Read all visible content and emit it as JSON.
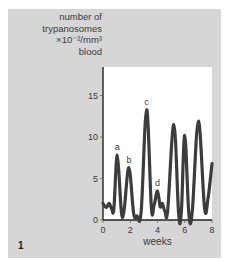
{
  "figure_number": "1",
  "colors": {
    "panel_background": "#d6d6d6",
    "plot_background": "#ffffff",
    "curve": "#3c3c3c",
    "text": "#3a3a3a"
  },
  "chart_data": {
    "type": "line",
    "title": "",
    "ylabel_lines": [
      "number of",
      "trypanosomes",
      "×10⁻²/mm³",
      "blood"
    ],
    "ylabel": "number of trypanosomes ×10⁻²/mm³ blood",
    "xlabel": "weeks",
    "xlim": [
      0,
      8
    ],
    "ylim": [
      0,
      18.5
    ],
    "xticks": [
      0,
      2,
      4,
      6,
      8
    ],
    "yticks": [
      0,
      5,
      10,
      15
    ],
    "grid": false,
    "legend": null,
    "series": [
      {
        "name": "parasitaemia",
        "x": [
          0,
          0.25,
          0.45,
          0.65,
          0.8,
          1.05,
          1.35,
          1.55,
          1.9,
          2.25,
          2.5,
          2.8,
          3.2,
          3.55,
          3.75,
          4.0,
          4.2,
          4.35,
          4.55,
          4.75,
          5.2,
          5.55,
          5.75,
          6.0,
          6.3,
          6.55,
          7.0,
          7.45,
          7.7,
          8.0
        ],
        "values": [
          2.0,
          1.5,
          2.0,
          1.3,
          1.4,
          7.8,
          1.0,
          1.2,
          6.3,
          0.8,
          0.5,
          1.0,
          13.3,
          1.5,
          1.8,
          3.5,
          1.6,
          2.0,
          1.0,
          1.2,
          11.5,
          0.8,
          1.0,
          10.2,
          0.8,
          1.0,
          11.9,
          1.5,
          2.5,
          6.8
        ]
      }
    ],
    "annotations": [
      {
        "text": "a",
        "x": 1.05,
        "y": 7.8
      },
      {
        "text": "b",
        "x": 1.9,
        "y": 6.3
      },
      {
        "text": "c",
        "x": 3.2,
        "y": 13.3
      },
      {
        "text": "d",
        "x": 4.0,
        "y": 3.5
      }
    ]
  }
}
